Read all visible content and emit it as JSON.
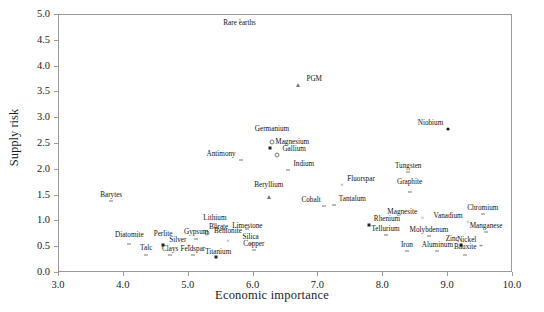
{
  "chart_data": {
    "type": "scatter",
    "title": "",
    "xlabel": "Economic importance",
    "ylabel": "Supply risk",
    "xlim": [
      3.0,
      10.0
    ],
    "ylim": [
      0.0,
      5.0
    ],
    "xticks": [
      "3.0",
      "4.0",
      "5.0",
      "6.0",
      "7.0",
      "8.0",
      "9.0",
      "10.0"
    ],
    "yticks": [
      "0.0",
      "0.5",
      "1.0",
      "1.5",
      "2.0",
      "2.5",
      "3.0",
      "3.5",
      "4.0",
      "4.5",
      "5.0"
    ],
    "grid": false,
    "legend": "none",
    "marker_color": "#333333",
    "points": [
      {
        "label": "Rare earths",
        "x": 5.8,
        "y": 4.88,
        "marker": "x",
        "lx": 5.8,
        "ly": 4.7,
        "align": "center"
      },
      {
        "label": "PGM",
        "x": 6.7,
        "y": 3.62,
        "marker": "tri",
        "lx": 6.83,
        "ly": 3.62,
        "align": "left"
      },
      {
        "label": "Niobium",
        "x": 9.02,
        "y": 2.78,
        "marker": "dot",
        "lx": 8.94,
        "ly": 2.78,
        "align": "right"
      },
      {
        "label": "Germanium",
        "x": 6.3,
        "y": 2.52,
        "marker": "open",
        "lx": 6.3,
        "ly": 2.66,
        "align": "center"
      },
      {
        "label": "Magnesium",
        "x": 6.27,
        "y": 2.4,
        "marker": "sq",
        "lx": 6.35,
        "ly": 2.4,
        "align": "left"
      },
      {
        "label": "Gallium",
        "x": 6.38,
        "y": 2.26,
        "marker": "open",
        "lx": 6.46,
        "ly": 2.26,
        "align": "left"
      },
      {
        "label": "Antimony",
        "x": 5.82,
        "y": 2.18,
        "marker": "tick",
        "lx": 5.74,
        "ly": 2.18,
        "align": "right"
      },
      {
        "label": "Indium",
        "x": 6.55,
        "y": 1.97,
        "marker": "tick",
        "lx": 6.63,
        "ly": 1.97,
        "align": "left"
      },
      {
        "label": "Tungsten",
        "x": 8.4,
        "y": 1.93,
        "marker": "tick",
        "lx": 8.4,
        "ly": 1.93,
        "align": "center"
      },
      {
        "label": "Fluorspar",
        "x": 7.38,
        "y": 1.68,
        "marker": "x",
        "lx": 7.46,
        "ly": 1.68,
        "align": "left"
      },
      {
        "label": "Graphite",
        "x": 8.42,
        "y": 1.55,
        "marker": "tick",
        "lx": 8.42,
        "ly": 1.62,
        "align": "center"
      },
      {
        "label": "Beryllium",
        "x": 6.25,
        "y": 1.45,
        "marker": "tri",
        "lx": 6.25,
        "ly": 1.57,
        "align": "center"
      },
      {
        "label": "Barytes",
        "x": 3.82,
        "y": 1.37,
        "marker": "tick",
        "lx": 3.82,
        "ly": 1.37,
        "align": "center"
      },
      {
        "label": "Cobalt",
        "x": 7.1,
        "y": 1.28,
        "marker": "tick",
        "lx": 7.05,
        "ly": 1.28,
        "align": "right"
      },
      {
        "label": "Tantalum",
        "x": 7.25,
        "y": 1.3,
        "marker": "tick",
        "lx": 7.33,
        "ly": 1.3,
        "align": "left"
      },
      {
        "label": "Chromium",
        "x": 9.55,
        "y": 1.12,
        "marker": "tick",
        "lx": 9.55,
        "ly": 1.12,
        "align": "center"
      },
      {
        "label": "Magnesite",
        "x": 8.62,
        "y": 1.05,
        "marker": "x",
        "lx": 8.54,
        "ly": 1.05,
        "align": "right"
      },
      {
        "label": "Vanadium",
        "x": 9.32,
        "y": 0.97,
        "marker": "x",
        "lx": 9.24,
        "ly": 0.97,
        "align": "right"
      },
      {
        "label": "Rhenium",
        "x": 7.8,
        "y": 0.92,
        "marker": "sq",
        "lx": 7.87,
        "ly": 0.92,
        "align": "left"
      },
      {
        "label": "Lithium",
        "x": 5.42,
        "y": 0.93,
        "marker": "tick",
        "lx": 5.42,
        "ly": 0.93,
        "align": "center"
      },
      {
        "label": "Limestone",
        "x": 5.92,
        "y": 0.84,
        "marker": "tick",
        "lx": 5.92,
        "ly": 0.78,
        "align": "center"
      },
      {
        "label": "Borate",
        "x": 5.3,
        "y": 0.76,
        "marker": "open",
        "lx": 5.33,
        "ly": 0.76,
        "align": "left"
      },
      {
        "label": "Manganese",
        "x": 9.6,
        "y": 0.78,
        "marker": "tick",
        "lx": 9.6,
        "ly": 0.78,
        "align": "center"
      },
      {
        "label": "Tellurium",
        "x": 8.05,
        "y": 0.72,
        "marker": "tick",
        "lx": 8.05,
        "ly": 0.72,
        "align": "center"
      },
      {
        "label": "Molybdenum",
        "x": 8.72,
        "y": 0.7,
        "marker": "tick",
        "lx": 8.72,
        "ly": 0.7,
        "align": "center"
      },
      {
        "label": "Gypsum",
        "x": 5.13,
        "y": 0.63,
        "marker": "tick",
        "lx": 5.13,
        "ly": 0.66,
        "align": "center"
      },
      {
        "label": "Bentonite",
        "x": 5.62,
        "y": 0.6,
        "marker": "x",
        "lx": 5.62,
        "ly": 0.68,
        "align": "center"
      },
      {
        "label": "Diatomite",
        "x": 4.1,
        "y": 0.55,
        "marker": "tick",
        "lx": 4.1,
        "ly": 0.6,
        "align": "center"
      },
      {
        "label": "Perlite",
        "x": 4.62,
        "y": 0.52,
        "marker": "sq",
        "lx": 4.62,
        "ly": 0.62,
        "align": "center"
      },
      {
        "label": "Silica",
        "x": 5.97,
        "y": 0.55,
        "marker": "tick",
        "lx": 5.97,
        "ly": 0.57,
        "align": "center"
      },
      {
        "label": "Silver",
        "x": 5.02,
        "y": 0.5,
        "marker": "plus",
        "lx": 4.98,
        "ly": 0.5,
        "align": "right"
      },
      {
        "label": "Zinc",
        "x": 9.22,
        "y": 0.52,
        "marker": "sq",
        "lx": 9.18,
        "ly": 0.52,
        "align": "right"
      },
      {
        "label": "Nickel",
        "x": 9.52,
        "y": 0.5,
        "marker": "plus",
        "lx": 9.45,
        "ly": 0.5,
        "align": "right"
      },
      {
        "label": "Copper",
        "x": 6.02,
        "y": 0.42,
        "marker": "tick",
        "lx": 6.02,
        "ly": 0.42,
        "align": "center"
      },
      {
        "label": "Aluminum",
        "x": 8.85,
        "y": 0.4,
        "marker": "tick",
        "lx": 8.85,
        "ly": 0.4,
        "align": "center"
      },
      {
        "label": "Iron",
        "x": 8.38,
        "y": 0.4,
        "marker": "tick",
        "lx": 8.38,
        "ly": 0.4,
        "align": "center"
      },
      {
        "label": "Bauxite",
        "x": 9.28,
        "y": 0.32,
        "marker": "tick",
        "lx": 9.28,
        "ly": 0.36,
        "align": "center"
      },
      {
        "label": "Talc",
        "x": 4.36,
        "y": 0.32,
        "marker": "tick",
        "lx": 4.36,
        "ly": 0.34,
        "align": "center"
      },
      {
        "label": "Clays",
        "x": 4.73,
        "y": 0.33,
        "marker": "tick",
        "lx": 4.73,
        "ly": 0.33,
        "align": "center"
      },
      {
        "label": "Feldspar",
        "x": 5.08,
        "y": 0.33,
        "marker": "tick",
        "lx": 5.08,
        "ly": 0.33,
        "align": "center"
      },
      {
        "label": "Titanium",
        "x": 5.43,
        "y": 0.3,
        "marker": "sq",
        "lx": 5.47,
        "ly": 0.27,
        "align": "center"
      }
    ]
  }
}
